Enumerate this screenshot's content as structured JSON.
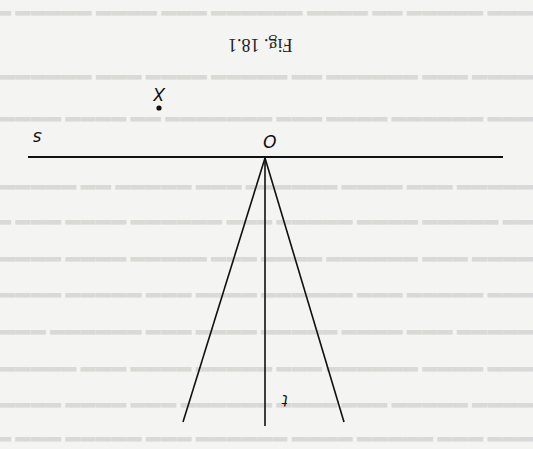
{
  "figure": {
    "caption": "Fig. 18.1",
    "orientation": "rotated 180 degrees",
    "labels": {
      "origin": "O",
      "point": "X",
      "horizontal_line": "s",
      "vertical_line": "t"
    },
    "colors": {
      "ink": "#111111",
      "paper": "#f4f4f2",
      "show_through_text": "#d9d9d6"
    }
  },
  "background_text_lines": [
    "",
    "",
    "",
    "",
    "",
    "",
    "",
    "",
    "",
    "",
    "",
    "",
    "",
    "",
    "",
    "",
    "",
    "",
    "",
    "",
    ""
  ]
}
